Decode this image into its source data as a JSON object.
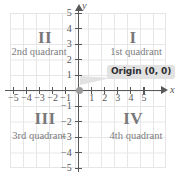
{
  "chart_data": {
    "type": "scatter",
    "title": "",
    "xlabel": "x",
    "ylabel": "y",
    "xlim": [
      -5.6,
      5.6
    ],
    "ylim": [
      -5.6,
      5.6
    ],
    "grid": true,
    "legend": "none",
    "x_ticks": [
      "−5",
      "−4",
      "−3",
      "−2",
      "−1",
      "1",
      "2",
      "3",
      "4",
      "5"
    ],
    "x_tick_values": [
      -5,
      -4,
      -3,
      -2,
      -1,
      1,
      2,
      3,
      4,
      5
    ],
    "y_ticks": [
      "5",
      "4",
      "3",
      "2",
      "1",
      "−1",
      "−2",
      "−3",
      "−4",
      "−5"
    ],
    "y_tick_values": [
      5,
      4,
      3,
      2,
      1,
      -1,
      -2,
      -3,
      -4,
      -5
    ],
    "points": [
      {
        "label": "Origin (0, 0)",
        "x": 0,
        "y": 0
      }
    ],
    "annotations": [
      {
        "text": "II",
        "role": "quadrant-numeral",
        "x": -3,
        "y": 4
      },
      {
        "text": "2nd quadrant",
        "role": "quadrant-name",
        "x": -3,
        "y": 3
      },
      {
        "text": "I",
        "role": "quadrant-numeral",
        "x": 3,
        "y": 4
      },
      {
        "text": "1st quadrant",
        "role": "quadrant-name",
        "x": 3,
        "y": 3
      },
      {
        "text": "III",
        "role": "quadrant-numeral",
        "x": -3,
        "y": -2
      },
      {
        "text": "3rd quadrant",
        "role": "quadrant-name",
        "x": -3,
        "y": -3
      },
      {
        "text": "IV",
        "role": "quadrant-numeral",
        "x": 3,
        "y": -2
      },
      {
        "text": "4th quadrant",
        "role": "quadrant-name",
        "x": 3,
        "y": -3
      },
      {
        "text": "Origin (0, 0)",
        "role": "callout",
        "x": 0,
        "y": 0
      }
    ]
  },
  "axes": {
    "x_letter": "x",
    "y_letter": "y",
    "x_tick_labels": [
      "−5",
      "−4",
      "−3",
      "−2",
      "−1",
      "1",
      "2",
      "3",
      "4",
      "5"
    ],
    "y_tick_labels": [
      "5",
      "4",
      "3",
      "2",
      "1",
      "−1",
      "−2",
      "−3",
      "−4",
      "−5"
    ]
  },
  "quadrants": {
    "first": {
      "numeral": "I",
      "name": "1st quadrant"
    },
    "second": {
      "numeral": "II",
      "name": "2nd quadrant"
    },
    "third": {
      "numeral": "III",
      "name": "3rd quadrant"
    },
    "fourth": {
      "numeral": "IV",
      "name": "4th quadrant"
    }
  },
  "origin": {
    "callout": "Origin (0, 0)"
  },
  "colors": {
    "grid": "#e6e6e6",
    "axis": "#58585a",
    "numeral": "#78787a",
    "quadrant_label": "#7c7c7e",
    "callout_background": "#e2e2e2",
    "callout_text": "#2f2f31",
    "origin_dot": "#9a9a9c",
    "background": "#ffffff"
  }
}
